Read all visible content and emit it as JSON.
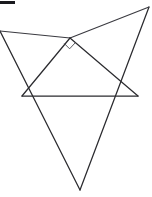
{
  "figure": {
    "background_color": "#ffffff",
    "line_color": "#2b2b2f",
    "canvas": {
      "width": 152,
      "height": 197
    },
    "corner_mark": {
      "name": "corner-mark",
      "color": "#1a1a1e",
      "x": 0,
      "y": 1,
      "width": 15,
      "height": 3
    },
    "points": {
      "apex": {
        "label": "apex",
        "x": 70,
        "y": 38
      },
      "base_left": {
        "label": "base-left",
        "x": 22,
        "y": 96
      },
      "base_right": {
        "label": "base-right",
        "x": 138,
        "y": 96
      },
      "bottom": {
        "label": "bottom",
        "x": 80,
        "y": 190
      },
      "top_right": {
        "label": "top-right",
        "x": 149,
        "y": 7
      },
      "left_edge": {
        "label": "left-edge",
        "x": 0,
        "y": 31
      }
    },
    "segments": [
      {
        "name": "base-line",
        "from": "base_left",
        "to": "base_right",
        "d": "M 22 96 L 138 96"
      },
      {
        "name": "apex-to-base-left",
        "from": "apex",
        "to": "base_left",
        "d": "M 70 38 L 22 96"
      },
      {
        "name": "apex-to-base-right",
        "from": "apex",
        "to": "base_right",
        "d": "M 70 38 L 138 96"
      },
      {
        "name": "apex-to-left-edge",
        "from": "apex",
        "to": "left_edge",
        "d": "M 70 38 L 0 31"
      },
      {
        "name": "apex-to-top-right",
        "from": "apex",
        "to": "top_right",
        "d": "M 70 38 L 149 7"
      },
      {
        "name": "left-edge-to-bottom",
        "from": "left_edge",
        "to": "bottom",
        "d": "M 0 31 L 80 190"
      },
      {
        "name": "top-right-to-bottom",
        "from": "top_right",
        "to": "bottom",
        "d": "M 149 7 L 80 190"
      }
    ],
    "angle_marker": {
      "name": "right-angle-marker",
      "vertex": "apex",
      "type": "right-angle-square",
      "d": "M 64.2 43.4 L 69.6 48.8 L 75.4 42.6"
    }
  }
}
